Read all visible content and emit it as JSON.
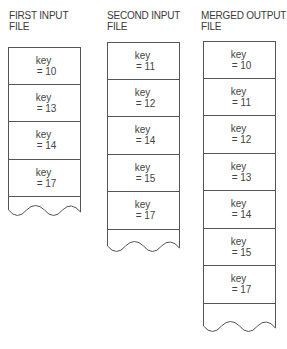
{
  "files": [
    {
      "title_line1": "FIRST INPUT",
      "title_line2": "FILE",
      "records": [
        {
          "label": "key",
          "value": "= 10"
        },
        {
          "label": "key",
          "value": "= 13"
        },
        {
          "label": "key",
          "value": "= 14"
        },
        {
          "label": "key",
          "value": "= 17"
        }
      ]
    },
    {
      "title_line1": "SECOND INPUT",
      "title_line2": "FILE",
      "records": [
        {
          "label": "key",
          "value": "= 11"
        },
        {
          "label": "key",
          "value": "= 12"
        },
        {
          "label": "key",
          "value": "= 14"
        },
        {
          "label": "key",
          "value": "= 15"
        },
        {
          "label": "key",
          "value": "= 17"
        }
      ]
    },
    {
      "title_line1": "MERGED OUTPUT",
      "title_line2": "FILE",
      "records": [
        {
          "label": "key",
          "value": "= 10"
        },
        {
          "label": "key",
          "value": "= 11"
        },
        {
          "label": "key",
          "value": "= 12"
        },
        {
          "label": "key",
          "value": "= 13"
        },
        {
          "label": "key",
          "value": "= 14"
        },
        {
          "label": "key",
          "value": "= 15"
        },
        {
          "label": "key",
          "value": "= 17"
        }
      ]
    }
  ]
}
